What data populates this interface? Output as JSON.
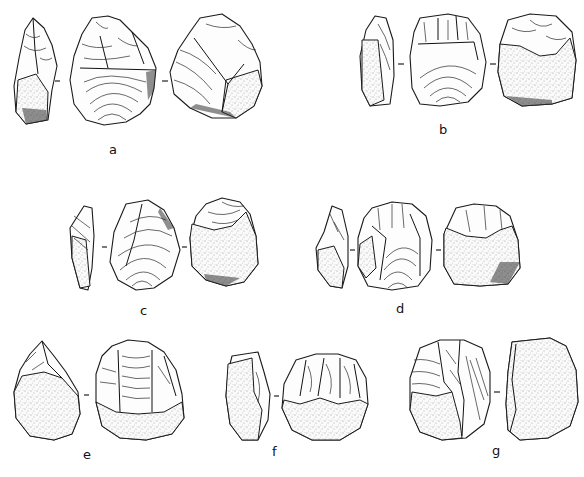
{
  "figure": {
    "type": "archaeological lithic illustration plate",
    "colors": {
      "background": "#ffffff",
      "ink": "#1a1a1a"
    },
    "artifacts": [
      {
        "id": "a",
        "label": "a",
        "views": [
          "side",
          "dorsal",
          "ventral"
        ]
      },
      {
        "id": "b",
        "label": "b",
        "views": [
          "side",
          "dorsal",
          "ventral"
        ]
      },
      {
        "id": "c",
        "label": "c",
        "views": [
          "side",
          "dorsal",
          "ventral"
        ]
      },
      {
        "id": "d",
        "label": "d",
        "views": [
          "side",
          "dorsal",
          "ventral"
        ]
      },
      {
        "id": "e",
        "label": "e",
        "views": [
          "side",
          "dorsal"
        ]
      },
      {
        "id": "f",
        "label": "f",
        "views": [
          "side",
          "dorsal"
        ]
      },
      {
        "id": "g",
        "label": "g",
        "views": [
          "dorsal",
          "side"
        ]
      }
    ]
  }
}
